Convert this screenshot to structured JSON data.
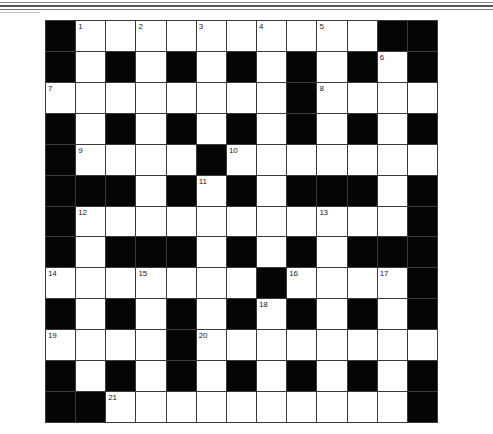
{
  "puzzle": {
    "type": "crossword",
    "rows": 13,
    "cols": 13,
    "colors": {
      "block": "#050505",
      "cell": "#ffffff",
      "gridline": "#3a3a3a",
      "number": "#222222"
    },
    "legend": "B = black block, . = empty white cell, number = numbered white cell",
    "grid": [
      [
        "B",
        "1",
        ".",
        "2",
        ".",
        "3",
        ".",
        "4",
        ".",
        "5",
        ".",
        "B",
        "B"
      ],
      [
        "B",
        ".",
        "B",
        ".",
        "B",
        ".",
        "B",
        ".",
        "B",
        ".",
        "B",
        "6",
        "B"
      ],
      [
        "7",
        ".",
        ".",
        ".",
        ".",
        ".",
        ".",
        ".",
        "B",
        "8",
        ".",
        ".",
        "."
      ],
      [
        "B",
        ".",
        "B",
        ".",
        "B",
        ".",
        "B",
        ".",
        "B",
        ".",
        "B",
        ".",
        "B"
      ],
      [
        "B",
        "9",
        ".",
        ".",
        ".",
        "B",
        "10",
        ".",
        ".",
        ".",
        ".",
        ".",
        "."
      ],
      [
        "B",
        "B",
        "B",
        ".",
        "B",
        "11",
        "B",
        ".",
        "B",
        "B",
        "B",
        ".",
        "B"
      ],
      [
        "B",
        "12",
        ".",
        ".",
        ".",
        ".",
        ".",
        ".",
        ".",
        "13",
        ".",
        ".",
        "B"
      ],
      [
        "B",
        ".",
        "B",
        "B",
        "B",
        ".",
        "B",
        ".",
        "B",
        ".",
        "B",
        "B",
        "B"
      ],
      [
        "14",
        ".",
        ".",
        "15",
        ".",
        ".",
        ".",
        "B",
        "16",
        ".",
        ".",
        "17",
        "B"
      ],
      [
        "B",
        ".",
        "B",
        ".",
        "B",
        ".",
        "B",
        "18",
        "B",
        ".",
        "B",
        ".",
        "B"
      ],
      [
        "19",
        ".",
        ".",
        ".",
        "B",
        "20",
        ".",
        ".",
        ".",
        ".",
        ".",
        ".",
        "."
      ],
      [
        "B",
        ".",
        "B",
        ".",
        "B",
        ".",
        "B",
        ".",
        "B",
        ".",
        "B",
        ".",
        "B"
      ],
      [
        "B",
        "B",
        "21",
        ".",
        ".",
        ".",
        ".",
        ".",
        ".",
        ".",
        ".",
        ".",
        "B"
      ]
    ],
    "clue_numbers": [
      1,
      2,
      3,
      4,
      5,
      6,
      7,
      8,
      9,
      10,
      11,
      12,
      13,
      14,
      15,
      16,
      17,
      18,
      19,
      20,
      21
    ]
  }
}
